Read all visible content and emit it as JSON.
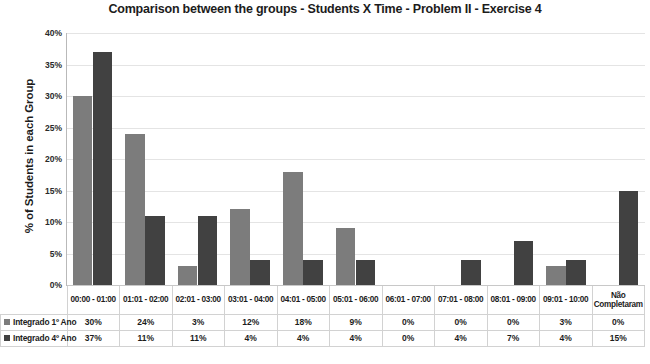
{
  "chart_data": {
    "type": "bar",
    "title": "Comparison between the groups - Students X Time - Problem II - Exercise 4",
    "xlabel": "",
    "ylabel": "% of Students in each Group",
    "ylim": [
      0,
      40
    ],
    "ytick_labels": [
      "40%",
      "35%",
      "30%",
      "25%",
      "20%",
      "15%",
      "10%",
      "5%",
      "0%"
    ],
    "ytick_values": [
      40,
      35,
      30,
      25,
      20,
      15,
      10,
      5,
      0
    ],
    "grid": true,
    "legend_position": "table-left",
    "categories": [
      "00:00 - 01:00",
      "01:01 - 02:00",
      "02:01 - 03:00",
      "03:01 - 04:00",
      "04:01 - 05:00",
      "05:01 - 06:00",
      "06:01 - 07:00",
      "07:01 - 08:00",
      "08:01 - 09:00",
      "09:01 - 10:00",
      "Não Completaram"
    ],
    "series": [
      {
        "name": "Integrado 1º Ano",
        "color": "#7c7c7c",
        "values": [
          30,
          24,
          3,
          12,
          18,
          9,
          0,
          0,
          0,
          3,
          0
        ],
        "labels": [
          "30%",
          "24%",
          "3%",
          "12%",
          "18%",
          "9%",
          "0%",
          "0%",
          "0%",
          "3%",
          "0%"
        ]
      },
      {
        "name": "Integrado 4º Ano",
        "color": "#414141",
        "values": [
          37,
          11,
          11,
          4,
          4,
          4,
          0,
          4,
          7,
          4,
          15
        ],
        "labels": [
          "37%",
          "11%",
          "11%",
          "4%",
          "4%",
          "4%",
          "0%",
          "4%",
          "7%",
          "4%",
          "15%"
        ]
      }
    ]
  }
}
